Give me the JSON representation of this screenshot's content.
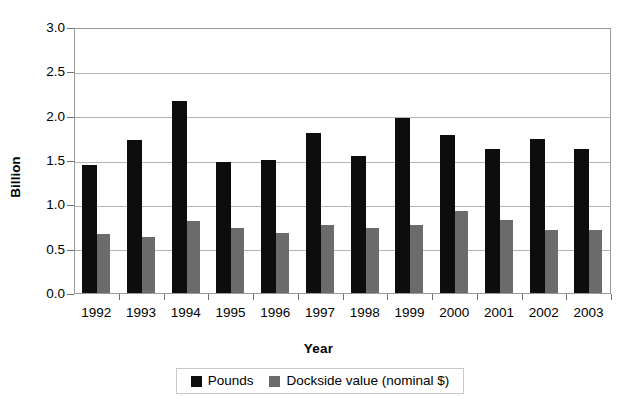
{
  "chart_data": {
    "type": "bar",
    "title": "",
    "xlabel": "Year",
    "ylabel": "Billion",
    "ylim": [
      0.0,
      3.0
    ],
    "ytick_step": 0.5,
    "ytick_labels": [
      "3.0",
      "2.5",
      "2.0",
      "1.5",
      "1.0",
      "0.5",
      "0.0"
    ],
    "grid": "horizontal",
    "legend_position": "bottom",
    "categories": [
      "1992",
      "1993",
      "1994",
      "1995",
      "1996",
      "1997",
      "1998",
      "1999",
      "2000",
      "2001",
      "2002",
      "2003"
    ],
    "series": [
      {
        "name": "Pounds",
        "color": "#0d0d0d",
        "values": [
          1.44,
          1.73,
          2.16,
          1.48,
          1.5,
          1.8,
          1.55,
          1.97,
          1.78,
          1.62,
          1.74,
          1.62
        ]
      },
      {
        "name": "Dockside value (nominal $)",
        "color": "#6b6b6b",
        "values": [
          0.66,
          0.63,
          0.81,
          0.73,
          0.68,
          0.77,
          0.73,
          0.77,
          0.93,
          0.82,
          0.71,
          0.71
        ]
      }
    ]
  },
  "legend": {
    "entries": [
      {
        "label": "Pounds",
        "color": "#0d0d0d"
      },
      {
        "label": "Dockside value (nominal $)",
        "color": "#6b6b6b"
      }
    ]
  }
}
